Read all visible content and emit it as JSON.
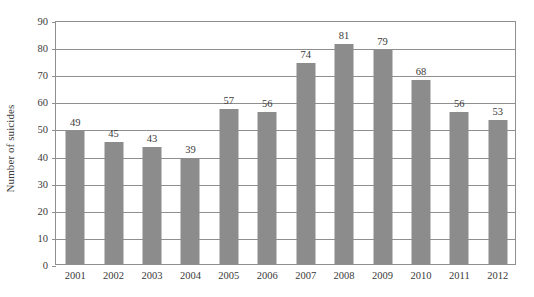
{
  "chart_data": {
    "type": "bar",
    "title": "",
    "subtitle": "",
    "xlabel": "",
    "ylabel": "Number of suicides",
    "categories": [
      "2001",
      "2002",
      "2003",
      "2004",
      "2005",
      "2006",
      "2007",
      "2008",
      "2009",
      "2010",
      "2011",
      "2012"
    ],
    "values": [
      49,
      45,
      43,
      39,
      57,
      56,
      74,
      81,
      79,
      68,
      56,
      53
    ],
    "data_labels": [
      "49",
      "45",
      "43",
      "39",
      "57",
      "56",
      "74",
      "81",
      "79",
      "68",
      "56",
      "53"
    ],
    "ylim": [
      0,
      90
    ],
    "yticks": [
      0,
      10,
      20,
      30,
      40,
      50,
      60,
      70,
      80,
      90
    ],
    "ytick_labels": [
      "0",
      "10",
      "20",
      "30",
      "40",
      "50",
      "60",
      "70",
      "80",
      "90"
    ],
    "grid": true,
    "grid_axis": "y",
    "legend": false,
    "legend_position": "none",
    "bar_color": "#8c8c8c",
    "axis_color": "#8f8f8f",
    "text_color": "#3a3a3a",
    "background": "#ffffff"
  }
}
